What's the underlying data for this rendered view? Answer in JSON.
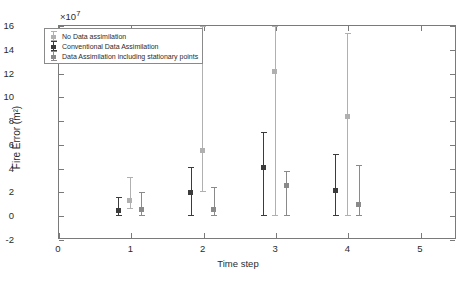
{
  "chart_data": {
    "type": "scatter",
    "title": "",
    "xlabel": "Time step",
    "ylabel": "Fire Error (m²)",
    "y_exponent_label": "×10",
    "y_exponent_value": "7",
    "xlim": [
      0,
      5.5
    ],
    "ylim": [
      -2,
      16
    ],
    "y_scale": 10000000.0,
    "xticks": [
      0,
      1,
      2,
      3,
      4,
      5
    ],
    "xticklabels": [
      "0",
      "1",
      "2",
      "3",
      "4",
      "5"
    ],
    "yticks": [
      -2,
      0,
      2,
      4,
      6,
      8,
      10,
      12,
      14,
      16
    ],
    "yticklabels": [
      "-2",
      "0",
      "2",
      "4",
      "6",
      "8",
      "10",
      "12",
      "14",
      "16"
    ],
    "grid": false,
    "legend_position": "upper left",
    "x": [
      1,
      2,
      3,
      4
    ],
    "series": [
      {
        "name": "No Data assimilation",
        "color": "#b0b0b0",
        "offset": -0.02,
        "values": [
          1.3,
          5.5,
          12.2,
          8.4
        ],
        "err_low": [
          0.7,
          3.5,
          12.2,
          8.4
        ],
        "err_high": [
          2.0,
          10.5,
          3.8,
          7.0
        ]
      },
      {
        "name": "Conventional Data Assimilation",
        "color": "#3b3b3b",
        "offset": -0.18,
        "values": [
          0.5,
          2.0,
          4.1,
          2.2
        ],
        "err_low": [
          0.5,
          2.0,
          4.1,
          2.2
        ],
        "err_high": [
          1.1,
          2.1,
          3.0,
          3.0
        ]
      },
      {
        "name": "Data Assimilation including stationary points",
        "color": "#8a8a8a",
        "offset": 0.14,
        "values": [
          0.6,
          0.6,
          2.6,
          1.0
        ],
        "err_low": [
          0.6,
          0.6,
          2.6,
          1.0
        ],
        "err_high": [
          1.4,
          1.9,
          1.2,
          3.3
        ]
      }
    ],
    "legend_entries": [
      "No Data assimilation",
      "Conventional Data Assimilation",
      "Data Assimilation including stationary points"
    ]
  }
}
